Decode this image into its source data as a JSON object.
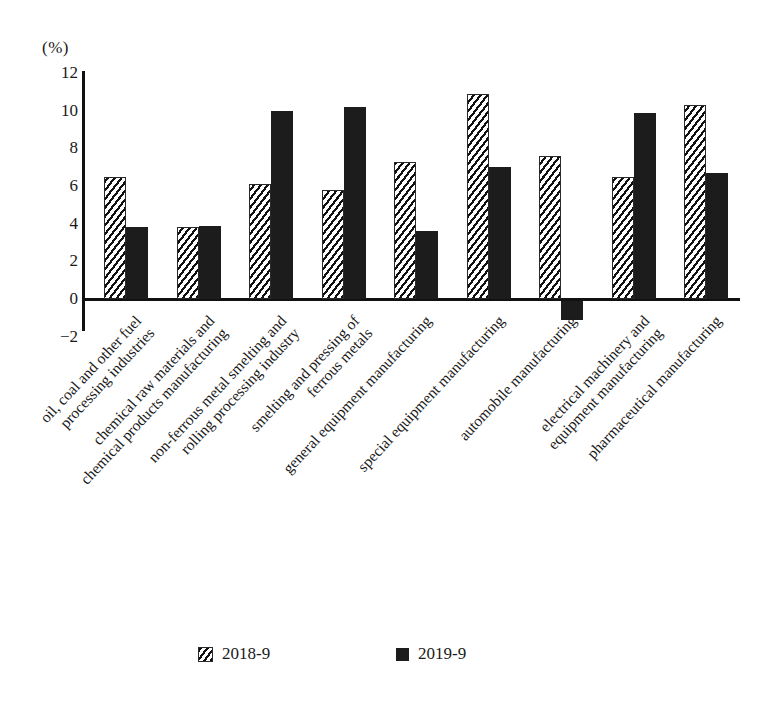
{
  "chart_data": {
    "type": "bar",
    "title": "",
    "subtitle": "",
    "xlabel": "",
    "ylabel": "",
    "unit_label": "(%)",
    "ylim": [
      -2,
      12
    ],
    "yticks": [
      12,
      10,
      8,
      6,
      4,
      2,
      0,
      -2
    ],
    "ytick_labels": [
      "12",
      "10",
      "8",
      "6",
      "4",
      "2",
      "0",
      "−2"
    ],
    "grid": false,
    "legend_position": "bottom",
    "categories": [
      "oil, coal and other fuel processing industries",
      "chemical raw materials and chemical products manufacturing",
      "non-ferrous metal smelting and rolling processing industry",
      "smelting and pressing of ferrous metals",
      "general equipment manufacturing",
      "special equipment manufacturing",
      "automobile manufacturing",
      "electrical machinery and equipment manufacturing",
      "pharmaceutical manufacturing"
    ],
    "category_lines": [
      [
        "oil, coal and other fuel",
        "processing industries"
      ],
      [
        "chemical raw materials and",
        "chemical products manufacturing"
      ],
      [
        "non-ferrous metal smelting and",
        "rolling processing industry"
      ],
      [
        "smelting and pressing of",
        "ferrous metals"
      ],
      [
        "general equipment manufacturing",
        ""
      ],
      [
        "special equipment manufacturing",
        ""
      ],
      [
        "automobile manufacturing",
        ""
      ],
      [
        "electrical machinery and",
        "equipment manufacturing"
      ],
      [
        "pharmaceutical manufacturing",
        ""
      ]
    ],
    "series": [
      {
        "name": "2018-9",
        "style": "hatched",
        "color": "#111111",
        "values": [
          6.5,
          3.8,
          6.1,
          5.8,
          7.3,
          10.9,
          7.6,
          6.5,
          10.3
        ]
      },
      {
        "name": "2019-9",
        "style": "solid",
        "color": "#1c1c1c",
        "values": [
          3.8,
          3.9,
          10.0,
          10.2,
          3.6,
          7.0,
          -1.0,
          9.9,
          6.7
        ]
      }
    ]
  },
  "legend": {
    "items": [
      {
        "label": "2018-9",
        "swatch": "hatched-square-swatch"
      },
      {
        "label": "2019-9",
        "swatch": "solid-square-swatch"
      }
    ]
  }
}
